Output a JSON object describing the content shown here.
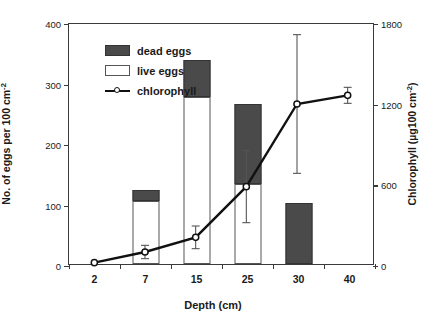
{
  "chart_data": {
    "type": "bar",
    "title": "",
    "xlabel": "Depth (cm)",
    "ylabel": "No. of eggs per 100 cm-2",
    "ylabel_main": "No. of eggs per 100 cm",
    "ylabel_main_sup": "-2",
    "ylabel2_main": "Chlorophyll (µg100 cm",
    "ylabel2_main_sup": "-2",
    "ylabel2_close": ")",
    "ylabel2": "Chlorophyll (µg100 cm-2)",
    "categories": [
      "2",
      "7",
      "15",
      "25",
      "30",
      "40"
    ],
    "ylim": [
      0,
      400
    ],
    "yticks": [
      "0",
      "100",
      "200",
      "300",
      "400"
    ],
    "ylim2": [
      0,
      1800
    ],
    "yticks2": [
      "0",
      "600",
      "1200",
      "1800"
    ],
    "grid": false,
    "legend_position": "top-left",
    "series": [
      {
        "name": "live eggs",
        "axis": "left",
        "type": "bar-stack",
        "color": "#ffffff",
        "values": [
          0,
          104,
          276,
          133,
          0,
          0
        ]
      },
      {
        "name": "dead eggs",
        "axis": "left",
        "type": "bar-stack",
        "color": "#4a4a4a",
        "values": [
          0,
          19,
          61,
          132,
          101,
          0
        ]
      },
      {
        "name": "chlorophyll",
        "axis": "right",
        "type": "line",
        "color": "#111111",
        "values": [
          10,
          90,
          200,
          580,
          1200,
          1265
        ],
        "errors": [
          0,
          50,
          85,
          270,
          520,
          60
        ]
      }
    ],
    "bar_totals": [
      0,
      123,
      337,
      265,
      101,
      0
    ]
  },
  "legend": {
    "items": [
      {
        "label": "dead eggs",
        "icon": "filled-square-swatch"
      },
      {
        "label": "live eggs",
        "icon": "hollow-square-swatch"
      },
      {
        "label": "chlorophyll",
        "icon": "line-circle-marker"
      }
    ]
  },
  "colors": {
    "dead_eggs": "#4a4a4a",
    "live_eggs": "#ffffff",
    "chlorophyll_line": "#111111",
    "axis": "#3a3a3a",
    "background": "#ffffff"
  }
}
